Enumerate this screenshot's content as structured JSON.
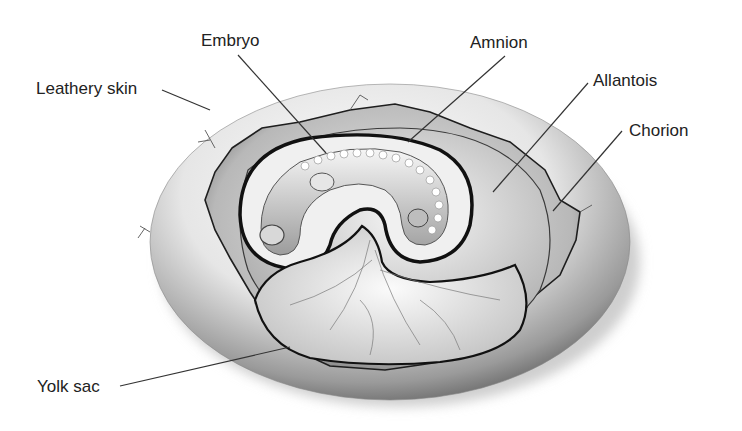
{
  "diagram": {
    "labels": [
      {
        "id": "leathery-skin",
        "text": "Leathery skin",
        "x": 36,
        "y": 80,
        "line": {
          "x1": 162,
          "y1": 90,
          "x2": 210,
          "y2": 110
        }
      },
      {
        "id": "embryo",
        "text": "Embryo",
        "x": 201,
        "y": 32,
        "line": {
          "x1": 238,
          "y1": 55,
          "x2": 326,
          "y2": 153
        }
      },
      {
        "id": "amnion",
        "text": "Amnion",
        "x": 470,
        "y": 34,
        "line": {
          "x1": 505,
          "y1": 56,
          "x2": 408,
          "y2": 142
        }
      },
      {
        "id": "allantois",
        "text": "Allantois",
        "x": 593,
        "y": 72,
        "line": {
          "x1": 588,
          "y1": 83,
          "x2": 493,
          "y2": 192
        }
      },
      {
        "id": "chorion",
        "text": "Chorion",
        "x": 629,
        "y": 122,
        "line": {
          "x1": 622,
          "y1": 131,
          "x2": 553,
          "y2": 211
        }
      },
      {
        "id": "yolk-sac",
        "text": "Yolk sac",
        "x": 37,
        "y": 378,
        "line": {
          "x1": 120,
          "y1": 386,
          "x2": 290,
          "y2": 347
        }
      }
    ],
    "colors": {
      "label_text": "#222222",
      "leader_line": "#333333",
      "shell_light": "#f4f4f4",
      "shell_dark": "#6e6e6e",
      "membrane_dark": "#111111"
    }
  }
}
